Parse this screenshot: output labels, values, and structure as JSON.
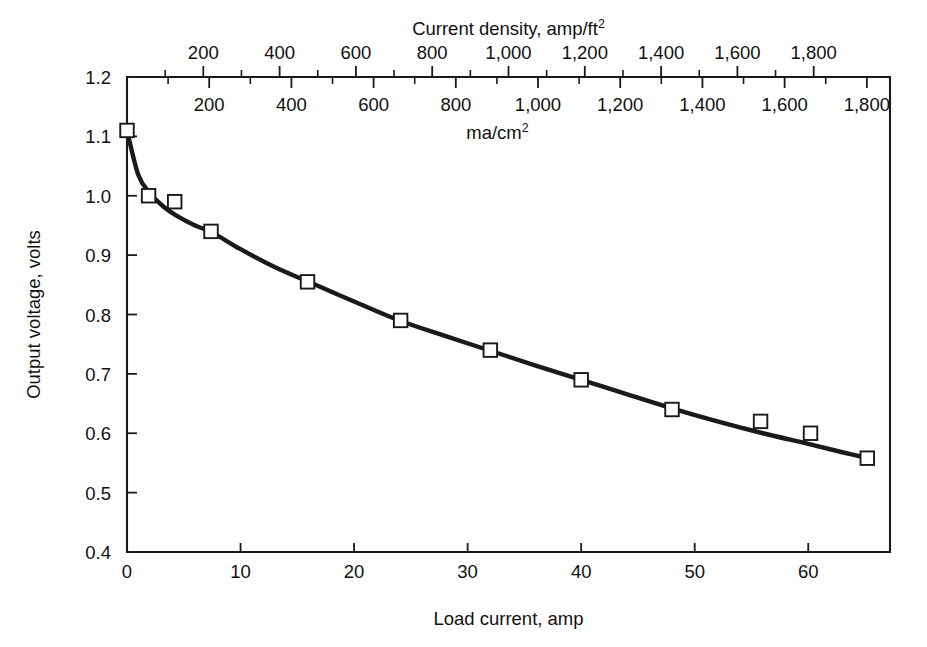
{
  "chart_data": {
    "type": "line",
    "title": "",
    "xlabel": "Load current, amp",
    "ylabel": "Output voltage, volts",
    "top_axis_title": "Current density, amp/ft",
    "top_axis_title_sup": "2",
    "secondary_axis_title": "ma/cm",
    "secondary_axis_title_sup": "2",
    "xlim": [
      0,
      67.2
    ],
    "ylim": [
      0.4,
      1.2
    ],
    "grid": false,
    "legend": "none",
    "x_ticks": [
      0,
      10,
      20,
      30,
      40,
      50,
      60
    ],
    "x_tick_labels": [
      "0",
      "10",
      "20",
      "30",
      "40",
      "50",
      "60"
    ],
    "y_ticks": [
      0.4,
      0.5,
      0.6,
      0.7,
      0.8,
      0.9,
      1.0,
      1.1,
      1.2
    ],
    "y_tick_labels": [
      "0.4",
      "0.5",
      "0.6",
      "0.7",
      "0.8",
      "0.9",
      "1.0",
      "1.1",
      "1.2"
    ],
    "top_axis": {
      "units": "amp/ft^2",
      "major_ticks": [
        200,
        400,
        600,
        800,
        1000,
        1200,
        1400,
        1600,
        1800
      ],
      "major_tick_labels": [
        "200",
        "400",
        "600",
        "800",
        "1,000",
        "1,200",
        "1,400",
        "1,600",
        "1,800"
      ],
      "minor_ticks": [
        100,
        300,
        500,
        700,
        900,
        1100,
        1300,
        1500,
        1700
      ],
      "amp_per_unit": 0.0336,
      "axis_max_value": 2000
    },
    "secondary_axis": {
      "units": "ma/cm^2",
      "major_ticks": [
        200,
        400,
        600,
        800,
        1000,
        1200,
        1400,
        1600,
        1800
      ],
      "major_tick_labels": [
        "200",
        "400",
        "600",
        "800",
        "1,000",
        "1,200",
        "1,400",
        "1,600",
        "1,800"
      ],
      "minor_ticks": [
        100,
        300,
        500,
        700,
        900,
        1100,
        1300,
        1500,
        1700
      ],
      "amp_per_unit": 0.0362,
      "axis_max_value": 1860
    },
    "series": [
      {
        "name": "Output voltage",
        "marker": "open-square",
        "points": [
          {
            "x": 0.0,
            "y": 1.11
          },
          {
            "x": 1.9,
            "y": 1.0
          },
          {
            "x": 4.2,
            "y": 0.99
          },
          {
            "x": 7.4,
            "y": 0.94
          },
          {
            "x": 15.9,
            "y": 0.855
          },
          {
            "x": 24.1,
            "y": 0.79
          },
          {
            "x": 32.0,
            "y": 0.74
          },
          {
            "x": 40.0,
            "y": 0.69
          },
          {
            "x": 48.0,
            "y": 0.64
          },
          {
            "x": 55.8,
            "y": 0.62
          },
          {
            "x": 60.2,
            "y": 0.6
          },
          {
            "x": 65.2,
            "y": 0.558
          }
        ]
      }
    ],
    "fitted_curve": [
      {
        "x": 0.0,
        "y": 1.11
      },
      {
        "x": 1.0,
        "y": 1.035
      },
      {
        "x": 2.0,
        "y": 1.005
      },
      {
        "x": 3.2,
        "y": 0.982
      },
      {
        "x": 4.5,
        "y": 0.965
      },
      {
        "x": 6.0,
        "y": 0.95
      },
      {
        "x": 7.6,
        "y": 0.937
      },
      {
        "x": 10.0,
        "y": 0.91
      },
      {
        "x": 13.0,
        "y": 0.88
      },
      {
        "x": 16.0,
        "y": 0.855
      },
      {
        "x": 20.0,
        "y": 0.822
      },
      {
        "x": 24.0,
        "y": 0.79
      },
      {
        "x": 28.0,
        "y": 0.764
      },
      {
        "x": 32.0,
        "y": 0.739
      },
      {
        "x": 36.0,
        "y": 0.714
      },
      {
        "x": 40.0,
        "y": 0.69
      },
      {
        "x": 44.0,
        "y": 0.666
      },
      {
        "x": 48.0,
        "y": 0.642
      },
      {
        "x": 52.0,
        "y": 0.62
      },
      {
        "x": 56.0,
        "y": 0.6
      },
      {
        "x": 60.0,
        "y": 0.582
      },
      {
        "x": 63.0,
        "y": 0.568
      },
      {
        "x": 65.5,
        "y": 0.557
      }
    ],
    "colors": {
      "line": "#1a1a1a",
      "marker_fill": "#ffffff",
      "axis": "#1a1a1a",
      "background": "#ffffff"
    }
  }
}
